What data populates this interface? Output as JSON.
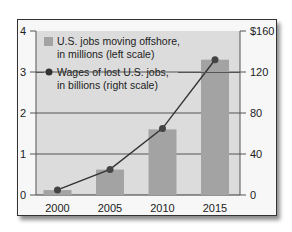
{
  "chart_data": {
    "type": "bar+line",
    "title": "",
    "categories": [
      "2000",
      "2005",
      "2010",
      "2015"
    ],
    "series": [
      {
        "name": "U.S. jobs moving offshore, in millions (left scale)",
        "type": "bar",
        "axis": "left",
        "values": [
          0.12,
          0.62,
          1.6,
          3.3
        ],
        "color": "#a3a3a3"
      },
      {
        "name": "Wages of lost U.S. jobs, in billions (right scale)",
        "type": "line",
        "axis": "right",
        "values": [
          5,
          25,
          65,
          132
        ],
        "color": "#333333"
      }
    ],
    "left_axis": {
      "ticks": [
        "0",
        "1",
        "2",
        "3",
        "4"
      ],
      "ylim": [
        0,
        4
      ]
    },
    "right_axis": {
      "ticks": [
        "0",
        "40",
        "80",
        "120",
        "$160"
      ],
      "ylim": [
        0,
        160
      ]
    },
    "xlabel": "",
    "ylabel": "",
    "grid": true,
    "legend_position": "top-left"
  },
  "legend": {
    "bar_line1": "U.S. jobs moving offshore,",
    "bar_line2": "in millions (left scale)",
    "line_line1": "Wages of lost U.S. jobs,",
    "line_line2": "in billions (right scale)"
  },
  "colors": {
    "plot_bg": "#dcdcdc",
    "bar": "#a3a3a3",
    "line": "#333333",
    "grid": "#555555"
  }
}
